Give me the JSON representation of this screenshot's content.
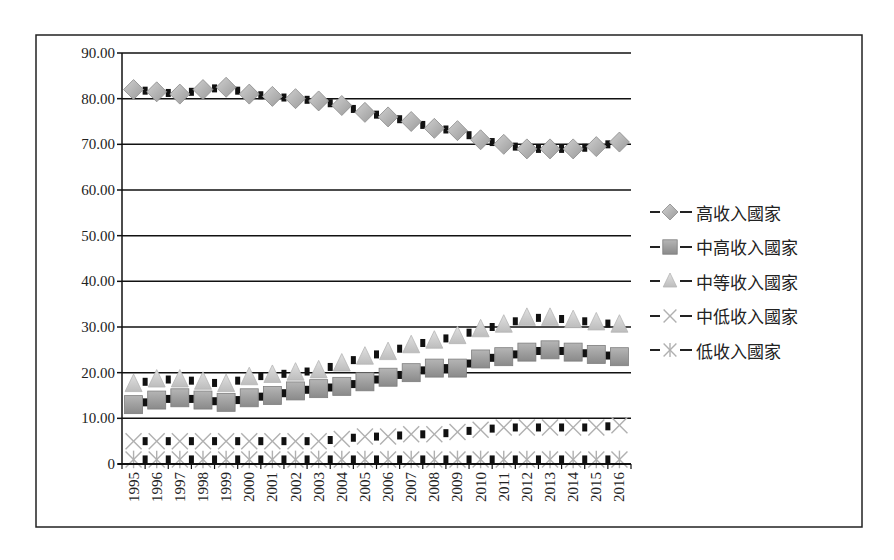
{
  "chart_data": {
    "type": "line",
    "title": "",
    "xlabel": "",
    "ylabel": "",
    "x": [
      "1995",
      "1996",
      "1997",
      "1998",
      "1999",
      "2000",
      "2001",
      "2002",
      "2003",
      "2004",
      "2005",
      "2006",
      "2007",
      "2008",
      "2009",
      "2010",
      "2011",
      "2012",
      "2013",
      "2014",
      "2015",
      "2016"
    ],
    "ylim": [
      0,
      90
    ],
    "yticks": [
      0,
      10,
      20,
      30,
      40,
      50,
      60,
      70,
      80,
      90
    ],
    "ytick_labels": [
      "0",
      "10.00",
      "20.00",
      "30.00",
      "40.00",
      "50.00",
      "60.00",
      "70.00",
      "80.00",
      "90.00"
    ],
    "grid": true,
    "legend_position": "right",
    "series": [
      {
        "name": "高收入國家",
        "marker": "diamond",
        "color": "#a8a8a8",
        "values": [
          82,
          81.5,
          81,
          82,
          82.5,
          81,
          80.5,
          80,
          79.5,
          78.5,
          77,
          76,
          75,
          73.5,
          73,
          71,
          70,
          69,
          69,
          69,
          69.5,
          70.5
        ]
      },
      {
        "name": "中高收入國家",
        "marker": "square",
        "color": "#9a9a9a",
        "values": [
          13,
          14,
          14.5,
          14,
          13.5,
          14.5,
          15,
          16,
          16.5,
          17,
          18,
          19,
          20,
          21,
          21,
          23,
          23.5,
          24.5,
          25,
          24.5,
          24,
          23.5
        ]
      },
      {
        "name": "中等收入國家",
        "marker": "triangle",
        "color": "#c8c8c8",
        "values": [
          17.5,
          18.5,
          18.5,
          18,
          17.5,
          19,
          19.5,
          20,
          20.5,
          22,
          23.5,
          24.5,
          26,
          27,
          28,
          29.5,
          30.5,
          32,
          32,
          31.5,
          31,
          30.5
        ]
      },
      {
        "name": "中低收入國家",
        "marker": "x",
        "color": "#b8b8b8",
        "values": [
          5,
          5,
          5,
          5,
          5,
          5,
          5,
          5,
          5,
          5.5,
          6,
          6,
          6.5,
          6.5,
          7,
          7.5,
          8,
          8,
          8,
          8,
          8,
          8.5
        ]
      },
      {
        "name": "低收入國家",
        "marker": "asterisk",
        "color": "#b8b8b8",
        "values": [
          1,
          1,
          1,
          1,
          1,
          1,
          1,
          1,
          1,
          1,
          1,
          1,
          1,
          1,
          1,
          1,
          1,
          1,
          1,
          1,
          1,
          1
        ]
      }
    ]
  }
}
